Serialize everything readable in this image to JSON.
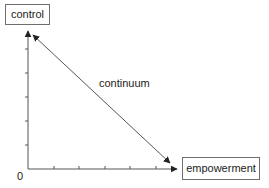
{
  "diagram": {
    "y_axis_label": "control",
    "x_axis_label": "empowerment",
    "diagonal_label": "continuum",
    "origin_label": "0",
    "line_color": "#555555",
    "box_border_color": "#6e6e6e",
    "y_ticks": 6,
    "x_ticks": 6
  }
}
